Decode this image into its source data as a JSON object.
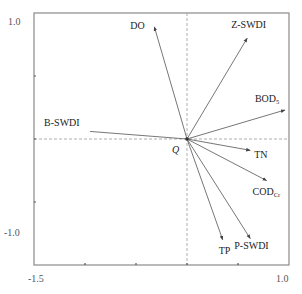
{
  "chart_data": {
    "type": "biplot",
    "title": "",
    "xlabel": "",
    "ylabel": "",
    "xlim": [
      -1.5,
      1.0
    ],
    "ylim": [
      -1.0,
      1.0
    ],
    "x_tick_labels": [
      "-1.5",
      "1.0"
    ],
    "y_tick_labels": [
      "1.0",
      "-1.0"
    ],
    "origin_label": "Q",
    "grid": false,
    "reference_lines": {
      "x": 0,
      "y": 0,
      "style": "dashed"
    },
    "vectors": [
      {
        "name": "DO",
        "x": -0.32,
        "y": 0.89
      },
      {
        "name": "Z-SWDI",
        "x": 0.59,
        "y": 0.8
      },
      {
        "name": "BOD5",
        "label_main": "BOD",
        "label_sub": "5",
        "x": 0.96,
        "y": 0.23
      },
      {
        "name": "B-SWDI",
        "x": -0.95,
        "y": 0.06
      },
      {
        "name": "TN",
        "x": 0.62,
        "y": -0.09
      },
      {
        "name": "CODCr",
        "label_main": "COD",
        "label_sub": "Cr",
        "x": 0.78,
        "y": -0.33
      },
      {
        "name": "P-SWDI",
        "x": 0.62,
        "y": -0.79
      },
      {
        "name": "TP",
        "x": 0.35,
        "y": -0.8
      }
    ]
  },
  "colors": {
    "axis": "#777777",
    "arrow": "#555555",
    "dashed": "#999999",
    "text": "#222222"
  }
}
